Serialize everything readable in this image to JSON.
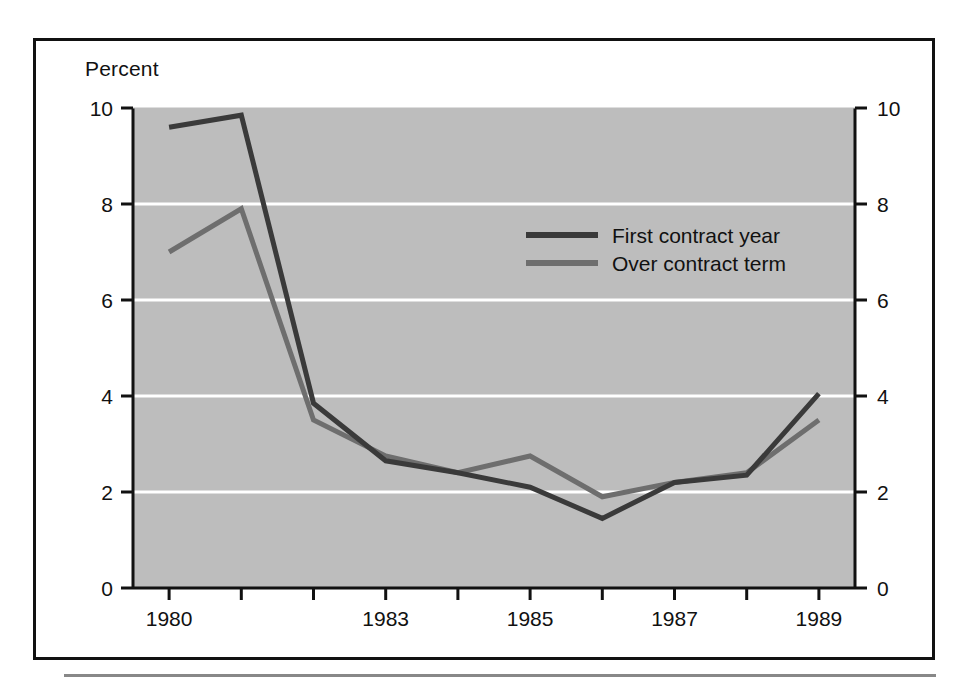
{
  "figure": {
    "axis_title": "Percent"
  },
  "chart_data": {
    "type": "line",
    "title": "",
    "subtitle": "",
    "xlabel": "",
    "ylabel": "Percent",
    "x": [
      1980,
      1981,
      1982,
      1983,
      1984,
      1985,
      1986,
      1987,
      1988,
      1989
    ],
    "xtick_values": [
      1980,
      1981,
      1982,
      1983,
      1984,
      1985,
      1986,
      1987,
      1988,
      1989
    ],
    "xtick_labels": [
      "1980",
      "",
      "",
      "1983",
      "",
      "1985",
      "",
      "1987",
      "",
      "1989"
    ],
    "xlim": [
      1979.5,
      1989.5
    ],
    "ytick_values": [
      0,
      2,
      4,
      6,
      8,
      10
    ],
    "ytick_labels": [
      "0",
      "2",
      "4",
      "6",
      "8",
      "10"
    ],
    "ylim": [
      0,
      10
    ],
    "grid": "horizontal-white-at-2-4-6-8",
    "right_axis": true,
    "right_ytick_labels": [
      "0",
      "2",
      "4",
      "6",
      "8",
      "10"
    ],
    "legend_position": "upper-center-right",
    "plot_background": "#bdbdbd",
    "series": [
      {
        "name": "First contract year",
        "color": "#3a3a3a",
        "values": [
          9.6,
          9.85,
          3.85,
          2.65,
          2.4,
          2.1,
          1.45,
          2.2,
          2.35,
          4.05
        ]
      },
      {
        "name": "Over contract term",
        "color": "#6e6e6e",
        "values": [
          7.0,
          7.9,
          3.5,
          2.75,
          2.4,
          2.75,
          1.9,
          2.2,
          2.4,
          3.5
        ]
      }
    ]
  },
  "axes_geometry": {
    "left": 133,
    "right": 855,
    "top": 108,
    "bottom": 588
  },
  "legend_geometry": {
    "swatch_x": 526,
    "swatch_x2": 598,
    "label_x": 612,
    "row1_y": 235,
    "row2_y": 263
  }
}
